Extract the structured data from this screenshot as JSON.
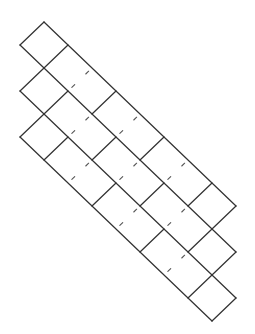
{
  "diagram": {
    "title": "",
    "canvas": {
      "width": 255,
      "height": 334,
      "background": "#ffffff"
    },
    "colors": {
      "line": "#333333",
      "fold": "#555555"
    },
    "lattice": {
      "origin": [
        44,
        22
      ],
      "unit_x": 24,
      "unit_y": 23,
      "note": "vertex (a,b) maps to x = origin.x + unit_x*(a-b), y = origin.y + unit_y*(a+b)"
    },
    "strips": [
      {
        "name": "strip-top",
        "b": [
          0,
          1
        ],
        "a_range": [
          0,
          8
        ],
        "solid_cross": [
          0,
          1,
          3,
          5,
          7,
          8
        ],
        "fold_cross": [
          2,
          4,
          6
        ]
      },
      {
        "name": "strip-middle",
        "b": [
          1,
          2
        ],
        "a_range": [
          1,
          9
        ],
        "solid_cross": [
          1,
          2,
          4,
          6,
          8,
          9
        ],
        "fold_cross": [
          3,
          5,
          7
        ]
      },
      {
        "name": "strip-bottom",
        "b": [
          2,
          3
        ],
        "a_range": [
          2,
          10
        ],
        "solid_cross": [
          2,
          3,
          5,
          7,
          9,
          10
        ],
        "fold_cross": [
          4,
          6,
          8
        ]
      }
    ],
    "long_edges": [
      {
        "b": 0,
        "a_from": 0,
        "a_to": 8
      },
      {
        "b": 1,
        "a_from": 0,
        "a_to": 9
      },
      {
        "b": 2,
        "a_from": 1,
        "a_to": 10
      },
      {
        "b": 3,
        "a_from": 2,
        "a_to": 10
      }
    ],
    "fold_style": {
      "marks": [
        [
          0.14,
          0.26
        ],
        [
          0.72,
          0.84
        ]
      ]
    }
  }
}
